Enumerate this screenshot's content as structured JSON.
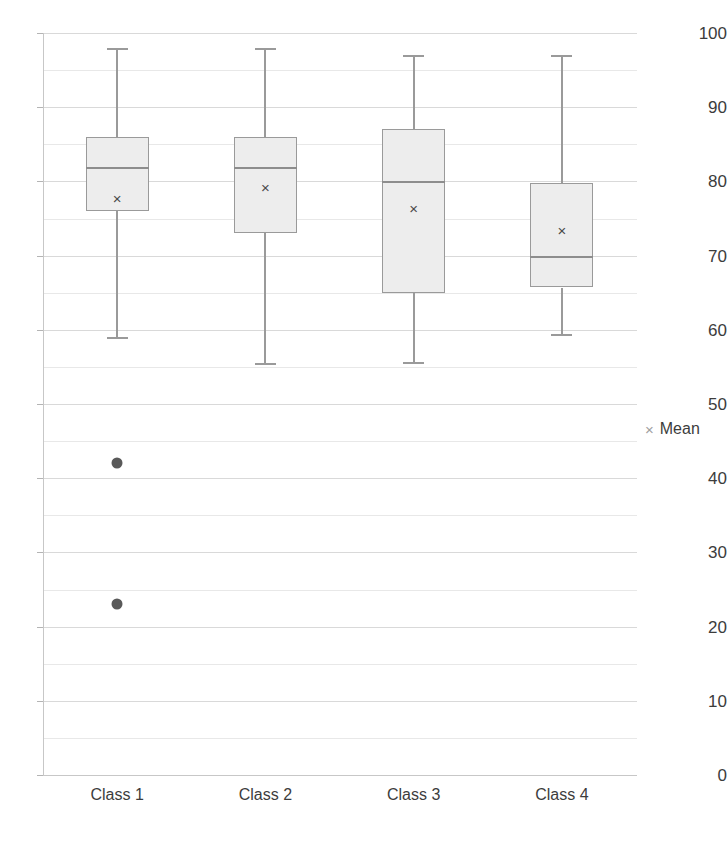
{
  "chart_data": {
    "type": "box",
    "title": "",
    "xlabel": "",
    "ylabel": "",
    "ylim": [
      0,
      100
    ],
    "y_major_step": 10,
    "y_minor_step": 5,
    "grid": true,
    "legend_position": "right",
    "categories": [
      "Class 1",
      "Class 2",
      "Class 3",
      "Class 4"
    ],
    "y_tick_labels": [
      "100",
      "90",
      "80",
      "70",
      "60",
      "50",
      "40",
      "30",
      "20",
      "10",
      "0"
    ],
    "y_tick_values": [
      100,
      90,
      80,
      70,
      60,
      50,
      40,
      30,
      20,
      10,
      0
    ],
    "legend": [
      {
        "label": "Mean",
        "glyph": "×",
        "color": "#a0a0a0"
      }
    ],
    "series": [
      {
        "name": "Class 1",
        "whisker_low": 59,
        "q1": 76,
        "median": 82,
        "q3": 86,
        "whisker_high": 98,
        "mean": 77.8,
        "outliers": [
          42,
          23
        ]
      },
      {
        "name": "Class 2",
        "whisker_low": 55.5,
        "q1": 73,
        "median": 82,
        "q3": 86,
        "whisker_high": 98,
        "mean": 79.2,
        "outliers": []
      },
      {
        "name": "Class 3",
        "whisker_low": 55.7,
        "q1": 65,
        "median": 80,
        "q3": 87,
        "whisker_high": 97,
        "mean": 76.4,
        "outliers": []
      },
      {
        "name": "Class 4",
        "whisker_low": 59.5,
        "q1": 65.7,
        "median": 70,
        "q3": 79.8,
        "whisker_high": 97,
        "mean": 73.5,
        "outliers": []
      }
    ],
    "colors": {
      "box_fill": "#ededed",
      "box_stroke": "#9a9a9a",
      "median": "#8d8d8d",
      "whisker": "#9a9a9a",
      "outlier": "#595959",
      "gridline": "#d9d9d9",
      "axis": "#c7c7c7",
      "text": "#3c3c3c"
    }
  }
}
